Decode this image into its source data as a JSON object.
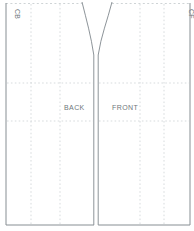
{
  "diagram": {
    "kind": "sewing-pattern-draft",
    "pieces": {
      "back": {
        "label": "BACK",
        "edge_label": "CB"
      },
      "front": {
        "label": "FRONT",
        "edge_label": "CF"
      }
    },
    "colors": {
      "background": "#ffffff",
      "outline_solid": "#878e93",
      "guide_dashed": "#d7dbdd",
      "label_text": "#6f777c"
    }
  }
}
